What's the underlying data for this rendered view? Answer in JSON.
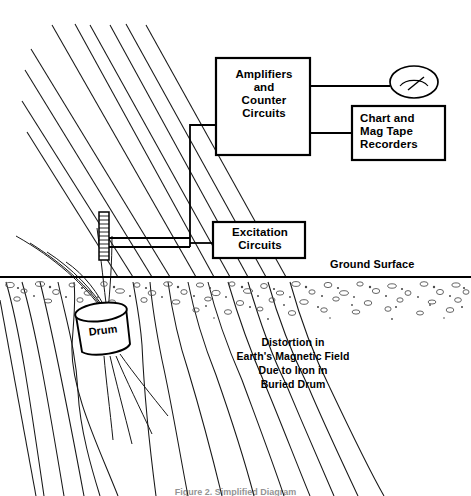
{
  "figure": {
    "caption": "Figure 2.  Simplified Diagram"
  },
  "blocks": [
    {
      "id": "amplifiers",
      "label": "Amplifiers\nand\nCounter\nCircuits"
    },
    {
      "id": "recorders",
      "label": "Chart and\nMag Tape\nRecorders"
    },
    {
      "id": "excitation",
      "label": "Excitation\nCircuits"
    }
  ],
  "labels": {
    "ground_surface": "Ground Surface",
    "drum": "Drum",
    "annotation": "Distortion in\nEarth's Magnetic Field\nDue to Iron in\nBuried Drum"
  },
  "icons": {
    "meter": "analog-meter-icon",
    "probe": "coil-probe-icon"
  },
  "colors": {
    "ink": "#000000",
    "field_line": "#1a1a1a",
    "soil": "#4a4a4a",
    "paper": "#ffffff"
  }
}
